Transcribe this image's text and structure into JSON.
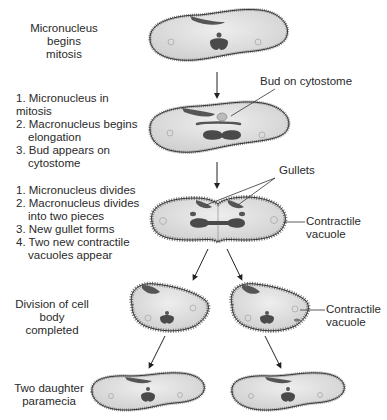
{
  "stages": [
    {
      "title": "Micronucleus begins mitosis"
    },
    {
      "steps": [
        "1. Micronucleus in mitosis",
        "2. Macronucleus begins elongation",
        "3. Bud appears on cytostome"
      ],
      "callout": "Bud on cytostome"
    },
    {
      "steps": [
        "1. Micronucleus divides",
        "2. Macronucleus divides into two pieces",
        "3. New gullet forms",
        "4. Two new contractile vacuoles appear"
      ],
      "callouts": [
        "Gullets",
        "Contractile vacuole"
      ]
    },
    {
      "title": "Division of cell body completed",
      "callout": "Contractile vacuole"
    },
    {
      "title": "Two daughter paramecia"
    }
  ],
  "labels": {
    "stage1_line1": "Micronucleus begins",
    "stage1_line2": "mitosis",
    "stage2_step1": "1. Micronucleus in mitosis",
    "stage2_step2": "2. Macronucleus begins",
    "stage2_step2b": "elongation",
    "stage2_step3": "3. Bud appears on",
    "stage2_step3b": "cytostome",
    "bud_callout": "Bud on cytostome",
    "stage3_step1": "1. Micronucleus divides",
    "stage3_step2": "2. Macronucleus divides",
    "stage3_step2b": "into two pieces",
    "stage3_step3": "3. New gullet forms",
    "stage3_step4": "4. Two new contractile",
    "stage3_step4b": "vacuoles appear",
    "gullets_callout": "Gullets",
    "cv_callout1_line1": "Contractile",
    "cv_callout1_line2": "vacuole",
    "stage4_line1": "Division of cell",
    "stage4_line2": "body completed",
    "cv_callout2_line1": "Contractile",
    "cv_callout2_line2": "vacuole",
    "stage5_line1": "Two daughter",
    "stage5_line2": "paramecia"
  },
  "colors": {
    "cell_fill": "#dcdcdc",
    "cell_outline": "#333333",
    "nucleus": "#4a4a4a",
    "text": "#2a2a2a"
  }
}
